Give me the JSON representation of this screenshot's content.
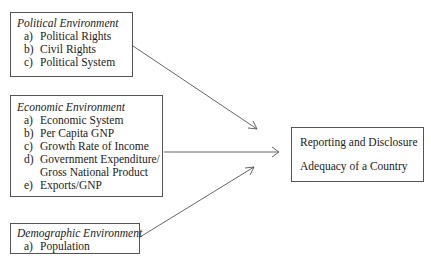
{
  "political": {
    "title": "Political Environment",
    "items": [
      {
        "label": "a)",
        "text": "Political Rights"
      },
      {
        "label": "b)",
        "text": "Civil Rights"
      },
      {
        "label": "c)",
        "text": "Political System"
      }
    ]
  },
  "economic": {
    "title": "Economic Environment",
    "items": [
      {
        "label": "a)",
        "text": "Economic System"
      },
      {
        "label": "b)",
        "text": "Per Capita GNP"
      },
      {
        "label": "c)",
        "text": "Growth Rate of Income"
      },
      {
        "label": "d)",
        "text": "Government Expenditure/"
      },
      {
        "label": "",
        "text": "Gross National Product"
      },
      {
        "label": "e)",
        "text": "Exports/GNP"
      }
    ]
  },
  "demographic": {
    "title": "Demographic Environment",
    "items": [
      {
        "label": "a)",
        "text": "Population"
      }
    ]
  },
  "outcome": {
    "line1": "Reporting and Disclosure",
    "line2": "Adequacy of a Country"
  },
  "colors": {
    "line": "#555555",
    "text": "#222222"
  }
}
